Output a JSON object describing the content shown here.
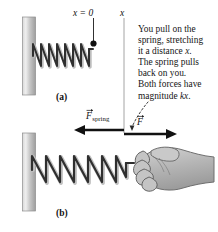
{
  "figure": {
    "panel_a": {
      "letter": "(a)",
      "origin_label": "x = 0",
      "axis_label": "x",
      "wall_color": "#b5b5b5",
      "spring_color": "#3a3a3a"
    },
    "panel_b": {
      "letter": "(b)",
      "force_spring": {
        "symbol": "F",
        "subscript": "spring",
        "direction": "left"
      },
      "force_hand": {
        "symbol": "F",
        "subscript": "",
        "direction": "right"
      },
      "hand_color": "#b0b0b0",
      "wall_color": "#b5b5b5",
      "spring_color": "#3a3a3a"
    },
    "callout": {
      "line1": "You pull on the",
      "line2_a": "spring, stretching",
      "line3_a": "it a distance ",
      "line3_italic": "x",
      "line3_b": ".",
      "line4": "The spring pulls",
      "line5": "back on you.",
      "line6": "Both forces have",
      "line7_a": "magnitude ",
      "line7_italic": "kx",
      "line7_b": "."
    }
  }
}
